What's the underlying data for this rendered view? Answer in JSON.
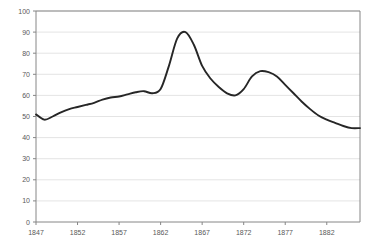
{
  "chart_data": {
    "type": "line",
    "title": "",
    "subtitle": "",
    "xlabel": "",
    "ylabel": "",
    "xlim": [
      1847,
      1886
    ],
    "ylim": [
      0,
      100
    ],
    "grid": true,
    "legend": false,
    "legend_position": "none",
    "y_ticks": [
      0,
      10,
      20,
      30,
      40,
      50,
      60,
      70,
      80,
      90,
      100
    ],
    "y_tick_labels": [
      "0",
      "10",
      "20",
      "30",
      "40",
      "50",
      "60",
      "70",
      "80",
      "90",
      "100"
    ],
    "x_ticks": [
      1847,
      1852,
      1857,
      1862,
      1867,
      1872,
      1877,
      1882
    ],
    "x_tick_labels": [
      "1847",
      "1852",
      "1857",
      "1862",
      "1867",
      "1872",
      "1877",
      "1882"
    ],
    "series": [
      {
        "name": "series-1",
        "color": "#262626",
        "x": [
          1847,
          1848,
          1849,
          1850,
          1851,
          1852,
          1853,
          1854,
          1855,
          1856,
          1857,
          1858,
          1859,
          1860,
          1861,
          1862,
          1863,
          1864,
          1865,
          1866,
          1867,
          1868,
          1869,
          1870,
          1871,
          1872,
          1873,
          1874,
          1875,
          1876,
          1877,
          1878,
          1879,
          1880,
          1881,
          1882,
          1883,
          1884,
          1885,
          1886
        ],
        "values": [
          51,
          48.5,
          50,
          52,
          53.5,
          54.5,
          55.5,
          56.5,
          58,
          59,
          59.5,
          60.5,
          61.5,
          62,
          61,
          63,
          74,
          87,
          90,
          84,
          74,
          68,
          64,
          61,
          60,
          63,
          69,
          71.5,
          71,
          69,
          65,
          61,
          57,
          53.5,
          50.5,
          48.5,
          47,
          45.5,
          44.5,
          44.5
        ]
      }
    ]
  },
  "plot": {
    "left_px": 36,
    "right_px": 360,
    "top_px": 11,
    "bottom_px": 222
  }
}
